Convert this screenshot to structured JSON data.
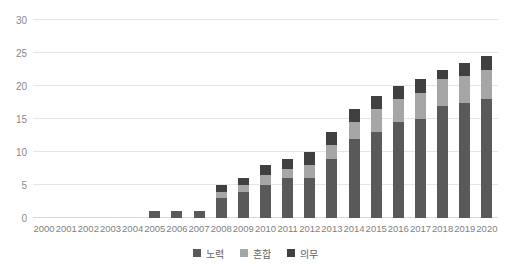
{
  "chart_data": {
    "type": "bar",
    "subtype": "stacked-column",
    "title": "",
    "xlabel": "",
    "ylabel": "",
    "ylim": [
      0,
      30
    ],
    "ytick_step": 5,
    "yticks": [
      0,
      5,
      10,
      15,
      20,
      25,
      30
    ],
    "grid": true,
    "legend_position": "bottom-center",
    "categories": [
      "2000",
      "2001",
      "2002",
      "2003",
      "2004",
      "2005",
      "2006",
      "2007",
      "2008",
      "2009",
      "2010",
      "2011",
      "2012",
      "2013",
      "2014",
      "2015",
      "2016",
      "2017",
      "2018",
      "2019",
      "2020"
    ],
    "series": [
      {
        "name": "노력",
        "color": "#595959",
        "values": [
          0,
          0,
          0,
          0,
          0,
          1,
          1,
          1,
          3,
          4,
          5,
          6,
          6,
          9,
          12,
          13,
          14.5,
          15,
          17,
          17.5,
          18
        ]
      },
      {
        "name": "혼합",
        "color": "#a6a6a6",
        "values": [
          0,
          0,
          0,
          0,
          0,
          0,
          0,
          0,
          1,
          1,
          1.5,
          1.5,
          2,
          2,
          2.5,
          3.5,
          3.5,
          4,
          4,
          4,
          4.5
        ]
      },
      {
        "name": "의무",
        "color": "#404040",
        "values": [
          0,
          0,
          0,
          0,
          0,
          0,
          0,
          0,
          1,
          1,
          1.5,
          1.5,
          2,
          2,
          2,
          2,
          2,
          2,
          1.5,
          2,
          2
        ]
      }
    ],
    "totals": [
      0,
      0,
      0,
      0,
      0,
      1,
      1,
      1,
      5,
      6,
      8,
      9,
      10,
      13,
      16.5,
      18.5,
      20,
      21,
      22.5,
      23.5,
      24.5
    ]
  },
  "legend": {
    "items": [
      {
        "label": "노력",
        "color": "#595959"
      },
      {
        "label": "혼합",
        "color": "#a6a6a6"
      },
      {
        "label": "의무",
        "color": "#404040"
      }
    ]
  }
}
